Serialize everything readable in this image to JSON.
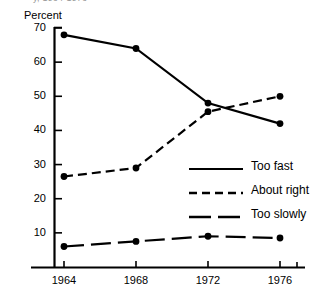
{
  "chart_data": {
    "type": "line",
    "title": "",
    "clipped_title_fragment": "y, 1964-1976",
    "xlabel": "",
    "ylabel": "Percent",
    "categories": [
      "1964",
      "1968",
      "1972",
      "1976"
    ],
    "x": [
      1964,
      1968,
      1972,
      1976
    ],
    "xlim": [
      1962,
      1978
    ],
    "ylim": [
      0,
      70
    ],
    "yticks": [
      10,
      20,
      30,
      40,
      50,
      60,
      70
    ],
    "ytick_labels": [
      "10",
      "20",
      "30",
      "40",
      "50",
      "60",
      "70"
    ],
    "xticks": [
      1964,
      1968,
      1972,
      1976
    ],
    "xtick_labels": [
      "1964",
      "1968",
      "1972",
      "1976"
    ],
    "grid": false,
    "legend_position": "center-right",
    "markers": "filled-circle",
    "series": [
      {
        "name": "Too fast",
        "style": "solid",
        "color": "#000000",
        "values": [
          68,
          64,
          48,
          42
        ]
      },
      {
        "name": "About right",
        "style": "dashed",
        "color": "#000000",
        "values": [
          26.5,
          29,
          45.5,
          50
        ]
      },
      {
        "name": "Too slowly",
        "style": "long-dash",
        "color": "#000000",
        "values": [
          6,
          7.5,
          9,
          8.5
        ]
      }
    ]
  },
  "legend": {
    "items": [
      {
        "label": "Too fast",
        "style": "solid"
      },
      {
        "label": "About right",
        "style": "dashed"
      },
      {
        "label": "Too slowly",
        "style": "long-dash"
      }
    ]
  },
  "colors": {
    "ink": "#000000",
    "background": "#ffffff"
  }
}
